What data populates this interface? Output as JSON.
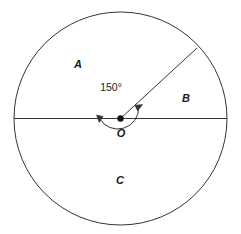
{
  "figure": {
    "background_color": "#ffffff",
    "stroke_color": "#333333",
    "text_color": "#1a1a1a"
  },
  "circle": {
    "center_x": 120.5,
    "center_y": 118.5,
    "radius": 106.5,
    "stroke_width": 1
  },
  "center_point": {
    "label": "O",
    "dot_radius": 3.2,
    "label_x": 121,
    "label_y": 133
  },
  "diameter": {
    "name": "horizontal-diameter",
    "x1": 14,
    "y1": 118.5,
    "x2": 227,
    "y2": 118.5
  },
  "radius_line": {
    "name": "radius-to-arc",
    "x1": 120.5,
    "y1": 118.5,
    "x2": 197,
    "y2": 48,
    "angle_degrees": 30
  },
  "angle_arc": {
    "value": "150°",
    "measure_degrees": 150,
    "arc_radius": 21,
    "start_angle_degrees": 30,
    "end_angle_degrees": 180,
    "label_x": 111,
    "label_y": 87,
    "arrowheads": "both"
  },
  "region_labels": [
    {
      "name": "region-a",
      "text": "A",
      "x": 78,
      "y": 64
    },
    {
      "name": "region-b",
      "text": "B",
      "x": 186,
      "y": 98
    },
    {
      "name": "region-c",
      "text": "C",
      "x": 120,
      "y": 180
    }
  ]
}
